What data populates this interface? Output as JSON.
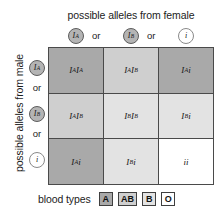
{
  "top_axis": {
    "title": "possible alleles from female",
    "alleles": [
      {
        "symbol": "I",
        "superscript": "A",
        "style": "filled",
        "name": "allele-IA"
      },
      {
        "symbol": "I",
        "superscript": "B",
        "style": "filled",
        "name": "allele-IB"
      },
      {
        "symbol": "i",
        "superscript": "",
        "style": "open",
        "name": "allele-i"
      }
    ],
    "separators": [
      "or",
      "or"
    ]
  },
  "left_axis": {
    "title": "possible alleles from male",
    "alleles": [
      {
        "symbol": "I",
        "superscript": "A",
        "style": "filled",
        "name": "allele-IA"
      },
      {
        "symbol": "I",
        "superscript": "B",
        "style": "filled",
        "name": "allele-IB"
      },
      {
        "symbol": "i",
        "superscript": "",
        "style": "open",
        "name": "allele-i"
      }
    ],
    "separators": [
      "or",
      "or"
    ]
  },
  "grid": {
    "rows": [
      {
        "male_allele": "I^A",
        "cells": [
          {
            "left": "I",
            "left_sup": "A",
            "right": "I",
            "right_sup": "A",
            "genotype": "IAIA",
            "blood_type": "A",
            "shade": "sh-A"
          },
          {
            "left": "I",
            "left_sup": "A",
            "right": "I",
            "right_sup": "B",
            "genotype": "IAIB",
            "blood_type": "AB",
            "shade": "sh-AB"
          },
          {
            "left": "I",
            "left_sup": "A",
            "right": "i",
            "right_sup": "",
            "genotype": "IAi",
            "blood_type": "A",
            "shade": "sh-A"
          }
        ]
      },
      {
        "male_allele": "I^B",
        "cells": [
          {
            "left": "I",
            "left_sup": "A",
            "right": "I",
            "right_sup": "B",
            "genotype": "IAIB",
            "blood_type": "AB",
            "shade": "sh-AB"
          },
          {
            "left": "I",
            "left_sup": "B",
            "right": "I",
            "right_sup": "B",
            "genotype": "IBIB",
            "blood_type": "B",
            "shade": "sh-B"
          },
          {
            "left": "I",
            "left_sup": "B",
            "right": "i",
            "right_sup": "",
            "genotype": "IBi",
            "blood_type": "B",
            "shade": "sh-B"
          }
        ]
      },
      {
        "male_allele": "i",
        "cells": [
          {
            "left": "I",
            "left_sup": "A",
            "right": "i",
            "right_sup": "",
            "genotype": "IAi",
            "blood_type": "A",
            "shade": "sh-A"
          },
          {
            "left": "I",
            "left_sup": "B",
            "right": "i",
            "right_sup": "",
            "genotype": "IBi",
            "blood_type": "B",
            "shade": "sh-B"
          },
          {
            "left": "i",
            "left_sup": "",
            "right": "i",
            "right_sup": "",
            "genotype": "ii",
            "blood_type": "O",
            "shade": "sh-O"
          }
        ]
      }
    ]
  },
  "legend": {
    "label": "blood types",
    "items": [
      {
        "label": "A",
        "shade": "sh-A",
        "color": "#a9a9a9"
      },
      {
        "label": "AB",
        "shade": "sh-AB",
        "color": "#cfcfcf"
      },
      {
        "label": "B",
        "shade": "sh-B",
        "color": "#e3e3e3"
      },
      {
        "label": "O",
        "shade": "sh-O",
        "color": "#ffffff"
      }
    ]
  }
}
